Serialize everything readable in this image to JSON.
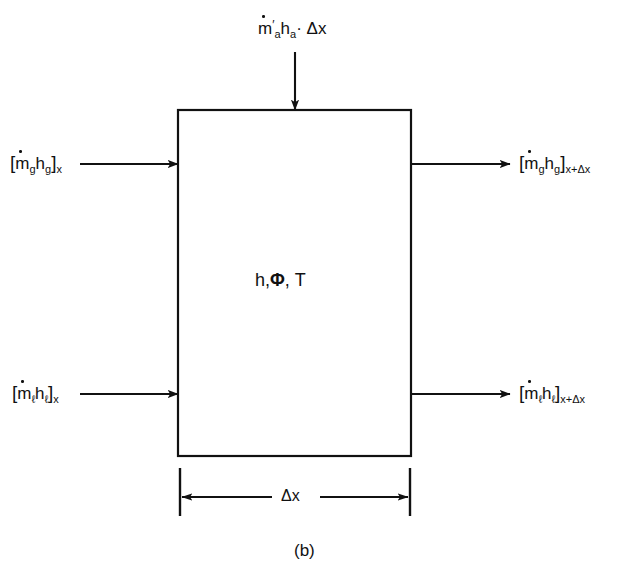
{
  "figure": {
    "caption": "(b)",
    "interior_label": {
      "enthalpy": "h",
      "phi": "Φ",
      "temperature": "T",
      "full": "h,Φ, T"
    },
    "dimension": {
      "label": "Δx",
      "name": "delta-x-dimension"
    },
    "control_volume": {
      "name": "control-volume-box",
      "x": 178,
      "y": 110,
      "width": 233,
      "height": 346
    }
  },
  "flows": {
    "top_inlet": {
      "name": "air-enthalpy-inlet",
      "text_parts": {
        "m": "m",
        "prime": "′",
        "m_sub": "a",
        "h": "h",
        "h_sub": "a",
        "dot_op": "·",
        "dx": "Δx"
      },
      "plain": "ṁ′a ha· Δx",
      "direction": "down"
    },
    "gas_in": {
      "name": "gas-enthalpy-inflow",
      "text_parts": {
        "open": "[",
        "m": "m",
        "m_sub": "g",
        "h": "h",
        "h_sub": "g",
        "close": "]",
        "station": "x"
      },
      "plain": "[ṁg hg]x",
      "direction": "right"
    },
    "gas_out": {
      "name": "gas-enthalpy-outflow",
      "text_parts": {
        "open": "[",
        "m": "m",
        "m_sub": "g",
        "h": "h",
        "h_sub": "g",
        "close": "]",
        "station": "x+Δx"
      },
      "plain": "[ṁg hg]x+Δx",
      "direction": "right"
    },
    "liquid_in": {
      "name": "liquid-enthalpy-inflow",
      "text_parts": {
        "open": "[",
        "m": "m",
        "m_sub": "ℓ",
        "h": "h",
        "h_sub": "ℓ",
        "close": "]",
        "station": "x"
      },
      "plain": "[ṁℓ hℓ]x",
      "direction": "right"
    },
    "liquid_out": {
      "name": "liquid-enthalpy-outflow",
      "text_parts": {
        "open": "[",
        "m": "m",
        "m_sub": "ℓ",
        "h": "h",
        "h_sub": "ℓ",
        "close": "]",
        "station": "x+Δx"
      },
      "plain": "[ṁℓ hℓ]x+Δx",
      "direction": "right"
    }
  },
  "style": {
    "ink": "#111111",
    "background": "#ffffff",
    "stroke_width": 2
  }
}
